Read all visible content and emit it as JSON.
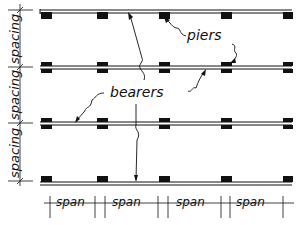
{
  "diagram": {
    "type": "floor framing plan",
    "labels": {
      "piers": "piers",
      "bearers": "bearers"
    },
    "dimensions": {
      "spacing_label": "spacing",
      "spacing_count": 3,
      "span_label": "span",
      "span_count": 4
    },
    "bearers": [
      {
        "y": 12,
        "pier_position": "below"
      },
      {
        "y": 68,
        "pier_position": "through"
      },
      {
        "y": 123,
        "pier_position": "through"
      },
      {
        "y": 183,
        "pier_position": "above"
      }
    ],
    "pier_x": [
      41,
      97,
      159,
      221,
      283
    ],
    "colors": {
      "ink": "#111111",
      "background": "#ffffff"
    }
  }
}
